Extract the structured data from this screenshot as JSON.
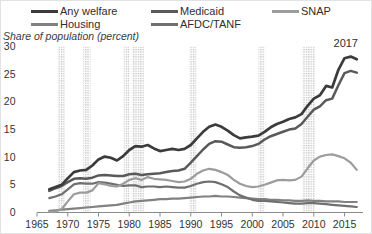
{
  "chart_data": {
    "type": "line",
    "title": "",
    "y_axis_title": "Share of population (percent)",
    "annotation": "2017",
    "legend_position": "top",
    "grid": false,
    "xlim": [
      1965,
      2018
    ],
    "ylim": [
      0,
      30
    ],
    "x_ticks": [
      1965,
      1970,
      1975,
      1980,
      1985,
      1990,
      1995,
      2000,
      2005,
      2010,
      2015
    ],
    "y_ticks": [
      0,
      5,
      10,
      15,
      20,
      25,
      30
    ],
    "x": [
      1967,
      1968,
      1969,
      1970,
      1971,
      1972,
      1973,
      1974,
      1975,
      1976,
      1977,
      1978,
      1979,
      1980,
      1981,
      1982,
      1983,
      1984,
      1985,
      1986,
      1987,
      1988,
      1989,
      1990,
      1991,
      1992,
      1993,
      1994,
      1995,
      1996,
      1997,
      1998,
      1999,
      2000,
      2001,
      2002,
      2003,
      2004,
      2005,
      2006,
      2007,
      2008,
      2009,
      2010,
      2011,
      2012,
      2013,
      2014,
      2015,
      2016,
      2017
    ],
    "series": [
      {
        "name": "Any welfare",
        "color": "#3b3b3b",
        "line_width": 2.7,
        "values": [
          4.2,
          4.6,
          5.0,
          6.2,
          7.3,
          7.6,
          7.7,
          8.5,
          9.6,
          10.1,
          9.9,
          9.4,
          10.2,
          11.3,
          12.0,
          11.9,
          12.2,
          11.6,
          11.1,
          11.3,
          11.5,
          11.3,
          11.5,
          12.2,
          13.4,
          14.6,
          15.5,
          15.9,
          15.5,
          14.8,
          14.0,
          13.4,
          13.6,
          13.7,
          13.9,
          14.6,
          15.4,
          16.0,
          16.4,
          16.9,
          17.2,
          17.8,
          19.3,
          20.6,
          21.2,
          22.9,
          22.6,
          25.8,
          27.9,
          28.2,
          27.7
        ]
      },
      {
        "name": "Medicaid",
        "color": "#595959",
        "line_width": 2.5,
        "values": [
          3.9,
          4.4,
          4.8,
          5.5,
          6.1,
          6.2,
          6.1,
          6.3,
          6.7,
          6.8,
          6.7,
          6.6,
          6.6,
          6.9,
          7.0,
          6.8,
          6.9,
          7.0,
          7.1,
          7.3,
          7.5,
          7.6,
          7.9,
          9.0,
          10.2,
          11.4,
          12.4,
          12.9,
          12.8,
          12.3,
          11.8,
          11.7,
          11.8,
          12.0,
          12.4,
          13.2,
          13.8,
          14.2,
          14.6,
          15.0,
          15.2,
          16.0,
          17.3,
          18.6,
          19.2,
          20.3,
          20.6,
          23.0,
          25.2,
          25.6,
          25.3
        ]
      },
      {
        "name": "SNAP",
        "color": "#9c9c9c",
        "line_width": 2.2,
        "values": [
          0.1,
          0.2,
          0.6,
          2.0,
          3.3,
          3.6,
          3.6,
          4.0,
          5.3,
          5.1,
          4.8,
          4.7,
          5.2,
          5.9,
          6.2,
          5.9,
          6.4,
          6.1,
          6.0,
          5.9,
          5.7,
          5.5,
          5.6,
          6.1,
          7.0,
          7.6,
          7.9,
          7.7,
          7.3,
          6.8,
          5.9,
          5.2,
          4.8,
          4.6,
          4.7,
          5.0,
          5.4,
          5.8,
          5.9,
          5.8,
          5.9,
          6.5,
          8.0,
          9.4,
          10.1,
          10.4,
          10.5,
          10.2,
          9.8,
          9.0,
          7.7
        ]
      },
      {
        "name": "Housing",
        "color": "#818181",
        "line_width": 2.2,
        "values": [
          0.3,
          0.4,
          0.5,
          0.6,
          0.7,
          0.8,
          0.9,
          1.0,
          1.1,
          1.2,
          1.3,
          1.4,
          1.6,
          1.8,
          2.0,
          2.1,
          2.2,
          2.3,
          2.4,
          2.4,
          2.5,
          2.5,
          2.6,
          2.7,
          2.8,
          2.9,
          2.9,
          3.0,
          2.9,
          2.9,
          2.8,
          2.7,
          2.6,
          2.5,
          2.4,
          2.4,
          2.3,
          2.3,
          2.2,
          2.2,
          2.1,
          2.1,
          2.2,
          2.1,
          2.1,
          2.0,
          2.0,
          2.0,
          1.9,
          1.9,
          1.9
        ]
      },
      {
        "name": "AFDC/TANF",
        "color": "#6f6f6f",
        "line_width": 2.2,
        "values": [
          2.6,
          2.9,
          3.3,
          4.2,
          5.1,
          5.3,
          5.2,
          5.2,
          5.5,
          5.4,
          5.2,
          5.0,
          4.8,
          4.9,
          4.9,
          4.6,
          4.7,
          4.7,
          4.6,
          4.7,
          4.6,
          4.5,
          4.5,
          4.8,
          5.2,
          5.5,
          5.6,
          5.5,
          5.1,
          4.6,
          3.8,
          3.1,
          2.7,
          2.3,
          2.1,
          2.1,
          2.0,
          1.9,
          1.8,
          1.7,
          1.6,
          1.6,
          1.7,
          1.7,
          1.6,
          1.5,
          1.4,
          1.3,
          1.2,
          1.1,
          1.0
        ]
      }
    ],
    "recession_bands": [
      [
        1968.4,
        1969.5
      ],
      [
        1972.5,
        1973.7
      ],
      [
        1979.1,
        1980.0
      ],
      [
        1980.4,
        1982.4
      ],
      [
        1989.8,
        1990.9
      ],
      [
        2001.0,
        2002.1
      ],
      [
        2008.2,
        2010.2
      ]
    ],
    "band_color": "#c2c2c2",
    "axis_color": "#8a8a8a",
    "text_color": "#333333"
  }
}
